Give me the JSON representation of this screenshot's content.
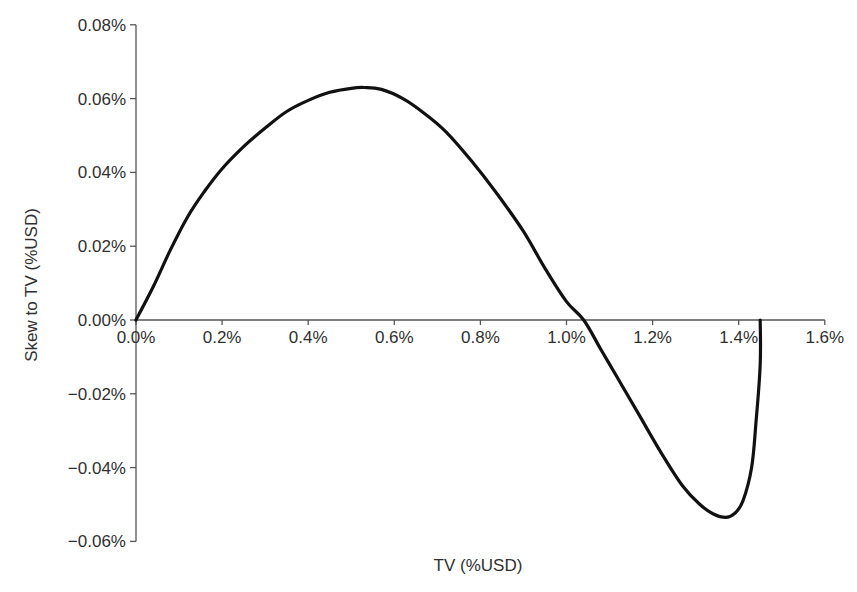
{
  "chart_data": {
    "type": "line",
    "title": "",
    "xlabel": "TV (%USD)",
    "ylabel": "Skew to TV (%USD)",
    "xlim": [
      0.0,
      1.6
    ],
    "ylim": [
      -0.06,
      0.08
    ],
    "x_ticks": [
      "0.0%",
      "0.2%",
      "0.4%",
      "0.6%",
      "0.8%",
      "1.0%",
      "1.2%",
      "1.4%",
      "1.6%"
    ],
    "y_ticks": [
      "0.08%",
      "0.06%",
      "0.04%",
      "0.02%",
      "0.00%",
      "−0.02%",
      "−0.04%",
      "−0.06%"
    ],
    "grid": false,
    "legend": null,
    "series": [
      {
        "name": "Skew to TV",
        "color": "#111111",
        "x": [
          0.0,
          0.04,
          0.08,
          0.12,
          0.16,
          0.2,
          0.25,
          0.3,
          0.35,
          0.4,
          0.45,
          0.5,
          0.53,
          0.57,
          0.62,
          0.67,
          0.72,
          0.78,
          0.84,
          0.9,
          0.95,
          1.0,
          1.04,
          1.08,
          1.12,
          1.17,
          1.22,
          1.27,
          1.31,
          1.34,
          1.37,
          1.39,
          1.41,
          1.43,
          1.44,
          1.45,
          1.45
        ],
        "y": [
          0.0,
          0.009,
          0.019,
          0.028,
          0.035,
          0.041,
          0.047,
          0.052,
          0.0565,
          0.0595,
          0.0617,
          0.0628,
          0.063,
          0.0625,
          0.06,
          0.056,
          0.051,
          0.043,
          0.034,
          0.024,
          0.014,
          0.005,
          0.0,
          -0.008,
          -0.016,
          -0.026,
          -0.036,
          -0.045,
          -0.05,
          -0.0525,
          -0.0535,
          -0.0525,
          -0.049,
          -0.04,
          -0.028,
          -0.012,
          0.0
        ]
      }
    ],
    "annotations": []
  }
}
